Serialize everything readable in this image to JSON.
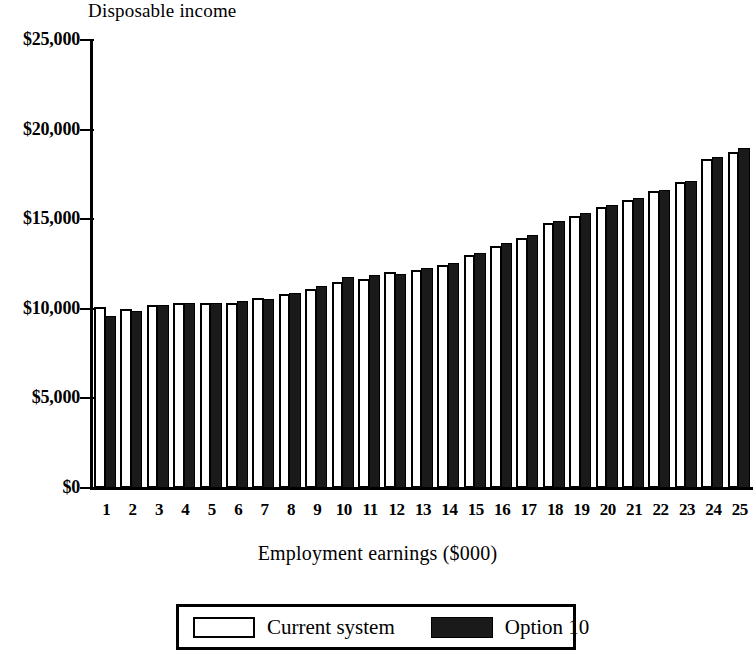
{
  "chart_data": {
    "type": "bar",
    "title": "",
    "ylabel": "Disposable income",
    "xlabel": "Employment earnings ($000)",
    "ylim": [
      0,
      25000
    ],
    "ytick_labels": [
      "$0",
      "$5,000",
      "$10,000",
      "$15,000",
      "$20,000",
      "$25,000"
    ],
    "ytick_values": [
      0,
      5000,
      10000,
      15000,
      20000,
      25000
    ],
    "grid": false,
    "legend_position": "bottom",
    "categories": [
      "1",
      "2",
      "3",
      "4",
      "5",
      "6",
      "7",
      "8",
      "9",
      "10",
      "11",
      "12",
      "13",
      "14",
      "15",
      "16",
      "17",
      "18",
      "19",
      "20",
      "21",
      "22",
      "23",
      "24",
      "25"
    ],
    "series": [
      {
        "name": "Current system",
        "color": "#ffffff",
        "edge_color": "#000000",
        "values": [
          10100,
          10000,
          10200,
          10350,
          10350,
          10350,
          10600,
          10800,
          11100,
          11500,
          11650,
          12050,
          12150,
          12450,
          13000,
          13500,
          13950,
          14800,
          15200,
          15700,
          16050,
          16550,
          17050,
          18350,
          18750
        ]
      },
      {
        "name": "Option 10",
        "color": "#1a1a1a",
        "edge_color": "#000000",
        "values": [
          9600,
          9900,
          10200,
          10350,
          10350,
          10450,
          10550,
          10900,
          11250,
          11750,
          11900,
          11950,
          12300,
          12550,
          13100,
          13700,
          14100,
          14900,
          15350,
          15800,
          16200,
          16650,
          17150,
          18450,
          19000
        ]
      }
    ]
  },
  "legend": {
    "entries": [
      {
        "label": "Current system",
        "swatch": "white-outline"
      },
      {
        "label": "Option 10",
        "swatch": "black-filled"
      }
    ]
  }
}
